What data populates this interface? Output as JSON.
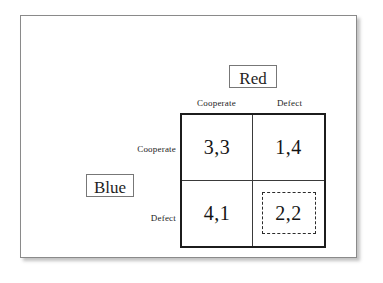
{
  "diagram": {
    "type": "payoff-matrix",
    "column_player": {
      "name": "Red",
      "strategies": [
        "Cooperate",
        "Defect"
      ]
    },
    "row_player": {
      "name": "Blue",
      "strategies": [
        "Cooperate",
        "Defect"
      ]
    },
    "cells": [
      {
        "row": "Cooperate",
        "column": "Cooperate",
        "payoff": "3,3",
        "equilibrium": false
      },
      {
        "row": "Cooperate",
        "column": "Defect",
        "payoff": "1,4",
        "equilibrium": false
      },
      {
        "row": "Defect",
        "column": "Cooperate",
        "payoff": "4,1",
        "equilibrium": false
      },
      {
        "row": "Defect",
        "column": "Defect",
        "payoff": "2,2",
        "equilibrium": true
      }
    ],
    "colors": {
      "frame_border": "#8a8a8a",
      "matrix_border": "#1c1c1c",
      "grid_line": "#3a3a3a",
      "label_box_border": "#777777",
      "text": "#1a1a1a",
      "page_background": "#ffffff"
    }
  }
}
